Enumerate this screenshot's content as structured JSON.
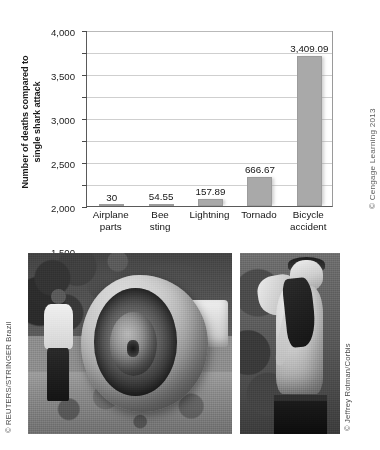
{
  "figure": {
    "chart_credit": "© Cengage Learning 2013",
    "y_axis_title_line1": "Number of deaths compared to",
    "y_axis_title_line2": "single shark attack"
  },
  "photos": {
    "left": {
      "alt_name": "airplane-wreckage-photo",
      "credit": "© REUTERS/STRINGER Brazil"
    },
    "right": {
      "alt_name": "shark-attack-survivor-photo",
      "credit": "© Jeffrey Rotman/Corbis"
    }
  },
  "chart_data": {
    "type": "bar",
    "title": "",
    "xlabel": "",
    "ylabel": "Number of deaths compared to single shark attack",
    "ylim": [
      0,
      4000
    ],
    "grid": true,
    "legend": "none",
    "categories": [
      "Airplane\nparts",
      "Bee\nsting",
      "Lightning",
      "Tornado",
      "Bicycle\naccident"
    ],
    "category_lines": [
      [
        "Airplane",
        "parts"
      ],
      [
        "Bee",
        "sting"
      ],
      [
        "Lightning",
        ""
      ],
      [
        "Tornado",
        ""
      ],
      [
        "Bicycle",
        "accident"
      ]
    ],
    "values": [
      30,
      54.55,
      157.89,
      666.67,
      3409.09
    ],
    "value_labels": [
      "30",
      "54.55",
      "157.89",
      "666.67",
      "3,409.09"
    ],
    "ytick_values": [
      0,
      500,
      1000,
      1500,
      2000,
      2500,
      3000,
      3500,
      4000
    ],
    "ytick_labels": [
      "0",
      "500",
      "1,000",
      "1,500",
      "2,000",
      "2,500",
      "3,000",
      "3,500",
      "4,000"
    ],
    "bar_color": "#a9a9a9"
  }
}
